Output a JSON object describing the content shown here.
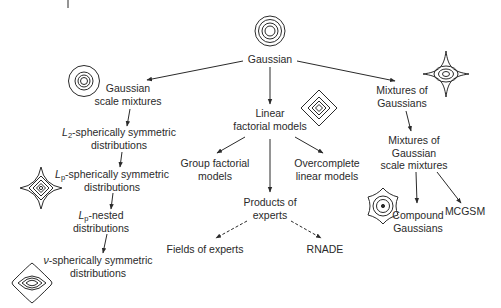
{
  "diagram": {
    "nodes": {
      "gaussian": {
        "label": "Gaussian"
      },
      "gsm": {
        "line1": "Gaussian",
        "line2": "scale mixtures"
      },
      "l2": {
        "prefix": "L",
        "sub": "2",
        "rest": "-spherically symmetric",
        "line2": "distributions"
      },
      "lp_sym": {
        "prefix": "L",
        "sub": "p",
        "rest": "-spherically symmetric",
        "line2": "distributions"
      },
      "lp_nested": {
        "prefix": "L",
        "sub": "p",
        "rest": "-nested",
        "line2": "distributions"
      },
      "nu_sym": {
        "prefix": "ν",
        "rest": "-spherically symmetric",
        "line2": "distributions"
      },
      "linear": {
        "line1": "Linear",
        "line2": "factorial models"
      },
      "group": {
        "line1": "Group factorial",
        "line2": "models"
      },
      "overcomplete": {
        "line1": "Overcomplete",
        "line2": "linear models"
      },
      "poe": {
        "line1": "Products of",
        "line2": "experts"
      },
      "foe": {
        "label": "Fields of experts"
      },
      "rnade": {
        "label": "RNADE"
      },
      "mog": {
        "line1": "Mixtures of",
        "line2": "Gaussians"
      },
      "mogsm": {
        "line1": "Mixtures of",
        "line2": "Gaussian",
        "line3": "scale mixtures"
      },
      "compound": {
        "line1": "Compound",
        "line2": "Gaussians"
      },
      "mcgsm": {
        "label": "MCGSM"
      }
    },
    "edges": [
      {
        "from": "gaussian",
        "to": "gsm",
        "style": "solid"
      },
      {
        "from": "gaussian",
        "to": "linear",
        "style": "solid"
      },
      {
        "from": "gaussian",
        "to": "mog",
        "style": "solid"
      },
      {
        "from": "gsm",
        "to": "l2",
        "style": "solid"
      },
      {
        "from": "l2",
        "to": "lp_sym",
        "style": "solid"
      },
      {
        "from": "lp_sym",
        "to": "lp_nested",
        "style": "solid"
      },
      {
        "from": "lp_nested",
        "to": "nu_sym",
        "style": "solid"
      },
      {
        "from": "linear",
        "to": "group",
        "style": "solid"
      },
      {
        "from": "linear",
        "to": "poe",
        "style": "solid"
      },
      {
        "from": "linear",
        "to": "overcomplete",
        "style": "solid"
      },
      {
        "from": "poe",
        "to": "foe",
        "style": "dashed"
      },
      {
        "from": "poe",
        "to": "rnade",
        "style": "dashed"
      },
      {
        "from": "mog",
        "to": "mogsm",
        "style": "solid"
      },
      {
        "from": "mogsm",
        "to": "compound",
        "style": "solid"
      },
      {
        "from": "mogsm",
        "to": "mcgsm",
        "style": "solid"
      }
    ],
    "icons": [
      "concentric-circles-icon",
      "circle-contours-icon",
      "diamond-contours-icon",
      "star-contours-icon",
      "astroid-contours-icon",
      "hexagram-contours-icon",
      "lens-diamond-contours-icon"
    ],
    "stroke_color": "#2a2a2a"
  }
}
